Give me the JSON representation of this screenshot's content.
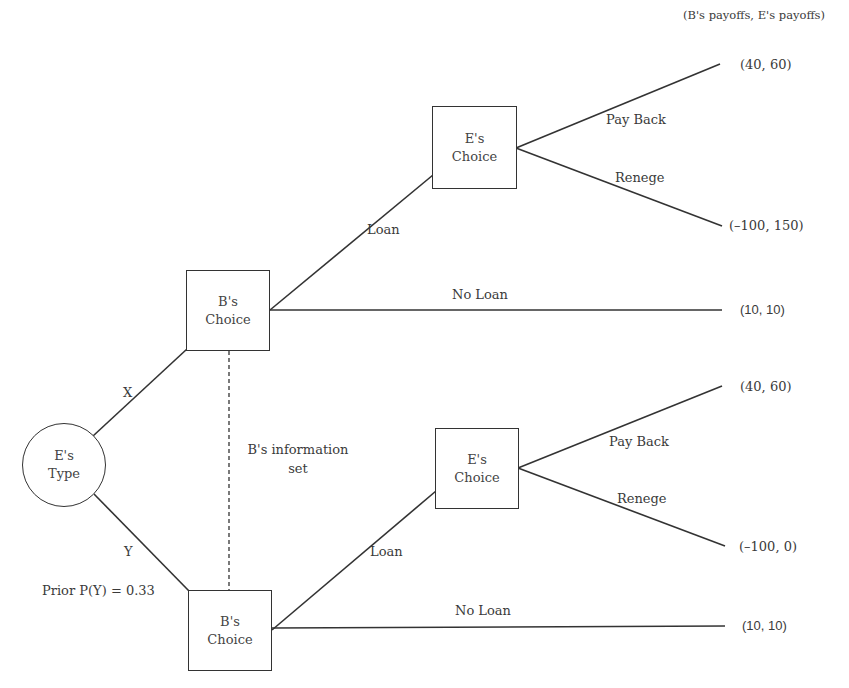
{
  "header": {
    "payoff_legend": "(B's payoffs, E's payoffs)"
  },
  "root": {
    "line1": "E's",
    "line2": "Type",
    "prior_label": "Prior P(Y) = 0.33"
  },
  "type_branches": {
    "x_label": "X",
    "y_label": "Y"
  },
  "information_set": {
    "line1": "B's information",
    "line2": "set"
  },
  "upper": {
    "b_node": {
      "line1": "B's",
      "line2": "Choice"
    },
    "e_node": {
      "line1": "E's",
      "line2": "Choice"
    },
    "loan_label": "Loan",
    "no_loan_label": "No Loan",
    "pay_back_label": "Pay Back",
    "renege_label": "Renege",
    "payoff_pay_back": "(40, 60)",
    "payoff_renege": "(–100, 150)",
    "payoff_no_loan": "(10, 10)"
  },
  "lower": {
    "b_node": {
      "line1": "B's",
      "line2": "Choice"
    },
    "e_node": {
      "line1": "E's",
      "line2": "Choice"
    },
    "loan_label": "Loan",
    "no_loan_label": "No Loan",
    "pay_back_label": "Pay Back",
    "renege_label": "Renege",
    "payoff_pay_back": "(40, 60)",
    "payoff_renege": "(–100, 0)",
    "payoff_no_loan": "(10, 10)"
  },
  "colors": {
    "line": "#333333",
    "text": "#3a3a3a",
    "background": "#ffffff"
  }
}
